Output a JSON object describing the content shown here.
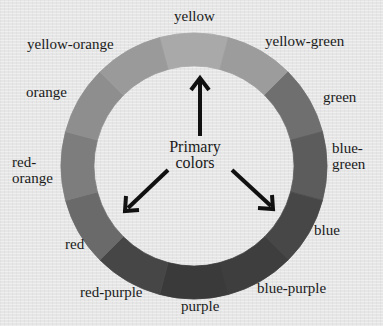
{
  "diagram": {
    "center_label_line1": "Primary",
    "center_label_line2": "colors",
    "segments": [
      {
        "name": "yellow",
        "shade": "#a9a9a9"
      },
      {
        "name": "yellow-green",
        "shade": "#9c9c9c"
      },
      {
        "name": "green",
        "shade": "#6f6f6f"
      },
      {
        "name": "blue-green",
        "shade": "#5c5c5c"
      },
      {
        "name": "blue",
        "shade": "#474747"
      },
      {
        "name": "blue-purple",
        "shade": "#3e3e3e"
      },
      {
        "name": "purple",
        "shade": "#3a3a3a"
      },
      {
        "name": "red-purple",
        "shade": "#464646"
      },
      {
        "name": "red",
        "shade": "#6a6a6a"
      },
      {
        "name": "red-orange",
        "shade": "#7d7d7d"
      },
      {
        "name": "orange",
        "shade": "#8e8e8e"
      },
      {
        "name": "yellow-orange",
        "shade": "#9a9a9a"
      }
    ],
    "labels": {
      "yellow": "yellow",
      "yellow_green": "yellow-green",
      "green": "green",
      "blue_green_1": "blue-",
      "blue_green_2": "green",
      "blue": "blue",
      "blue_purple": "blue-purple",
      "purple": "purple",
      "red_purple": "red-purple",
      "red": "red",
      "red_orange_1": "red-",
      "red_orange_2": "orange",
      "orange": "orange",
      "yellow_orange": "yellow-orange"
    },
    "arrows_point_to": [
      "yellow",
      "red",
      "blue"
    ]
  }
}
